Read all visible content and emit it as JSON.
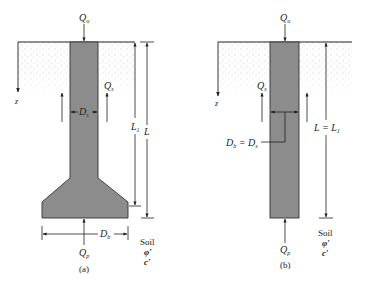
{
  "figure": {
    "panel_a": {
      "caption": "(a)",
      "load_top": "Q",
      "load_top_sub": "u",
      "skin_friction": "Q",
      "skin_friction_sub": "s",
      "shaft_diameter": "D",
      "shaft_diameter_sub": "s",
      "bell_diameter": "D",
      "bell_diameter_sub": "b",
      "point_load": "Q",
      "point_load_sub": "p",
      "length_shaft": "L",
      "length_shaft_sub": "1",
      "length_total": "L",
      "depth_axis": "z",
      "soil_label": "Soil",
      "soil_phi": "φ′",
      "soil_c": "c′"
    },
    "panel_b": {
      "caption": "(b)",
      "load_top": "Q",
      "load_top_sub": "u",
      "skin_friction": "Q",
      "skin_friction_sub": "s",
      "diameter_eq_left": "D",
      "diameter_eq_left_sub": "b",
      "diameter_eq_mid": " = D",
      "diameter_eq_right_sub": "s",
      "point_load": "Q",
      "point_load_sub": "p",
      "length_eq": "L = L",
      "length_eq_sub": "1",
      "depth_axis": "z",
      "soil_label": "Soil",
      "soil_phi": "φ′",
      "soil_c": "c′"
    },
    "colors": {
      "pile_fill": "#8c8c8c",
      "line": "#222222",
      "soil_dots": "#9a9a9a"
    }
  }
}
